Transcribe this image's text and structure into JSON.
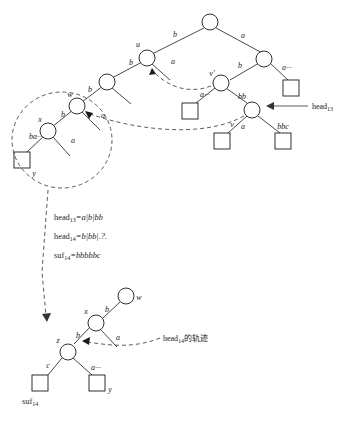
{
  "figure": {
    "upper_tree": {
      "node_labels": [
        {
          "id": "u",
          "text": "u"
        },
        {
          "id": "w",
          "text": "w"
        },
        {
          "id": "x",
          "text": "x"
        },
        {
          "id": "y",
          "text": "y"
        },
        {
          "id": "v",
          "text": "v"
        },
        {
          "id": "vprime",
          "text": "v'"
        }
      ],
      "edge_labels": [
        {
          "id": "root-left",
          "text": "b"
        },
        {
          "id": "root-right",
          "text": "a"
        },
        {
          "id": "u-left",
          "text": "b"
        },
        {
          "id": "u-right",
          "text": "a"
        },
        {
          "id": "w-in",
          "text": "b"
        },
        {
          "id": "w-right",
          "text": "a"
        },
        {
          "id": "x-left",
          "text": "b"
        },
        {
          "id": "x-right",
          "text": "a"
        },
        {
          "id": "r-left",
          "text": "b"
        },
        {
          "id": "r-right",
          "text": "a···"
        },
        {
          "id": "vp-left",
          "text": "a···"
        },
        {
          "id": "vp-right",
          "text": "bb"
        },
        {
          "id": "v-left",
          "text": "a"
        },
        {
          "id": "v-right",
          "text": "bbc"
        },
        {
          "id": "circle-region",
          "text": "ba···"
        }
      ],
      "pointer_label": "head",
      "pointer_sub": "13"
    },
    "equations": [
      {
        "lhs": "head",
        "sub": "13",
        "rhs": "=a|b|bb"
      },
      {
        "lhs": "head",
        "sub": "14",
        "rhs": "=b|bb|.?."
      },
      {
        "lhs": "suf",
        "sub": "14",
        "rhs": "=bbbbbc"
      }
    ],
    "lower_tree": {
      "node_labels": [
        {
          "id": "w",
          "text": "w"
        },
        {
          "id": "x",
          "text": "x"
        },
        {
          "id": "z",
          "text": "z"
        },
        {
          "id": "y",
          "text": "y"
        }
      ],
      "edge_labels": [
        {
          "id": "x-w",
          "text": "b"
        },
        {
          "id": "x-z",
          "text": "b"
        },
        {
          "id": "x-a",
          "text": "a"
        },
        {
          "id": "z-left",
          "text": "c"
        },
        {
          "id": "z-right",
          "text": "a···"
        }
      ],
      "suffix_label": "suf",
      "suffix_sub": "14",
      "trace_label": "head",
      "trace_sub": "14",
      "trace_suffix": "的轨迹"
    },
    "colors": {
      "ink": "#1a1a1a",
      "dash": "#333333",
      "background": "#ffffff"
    }
  }
}
